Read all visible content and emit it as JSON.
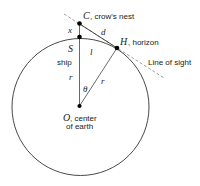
{
  "diagram": {
    "points": {
      "C": {
        "letter": "C",
        "label": ", crow's nest"
      },
      "H": {
        "letter": "H",
        "label": ", horizon"
      },
      "S": {
        "letter": "S",
        "label": "ship"
      },
      "O": {
        "letter": "O",
        "label_line1": ", center",
        "label_line2": "of earth"
      }
    },
    "segments": {
      "x": "x",
      "d": "d",
      "l": "l",
      "r_left": "r",
      "r_right": "r",
      "theta": "θ"
    },
    "line_of_sight": "Line of sight",
    "colors": {
      "stroke": "#333333",
      "dashed": "#888888",
      "dot": "#000000"
    }
  }
}
